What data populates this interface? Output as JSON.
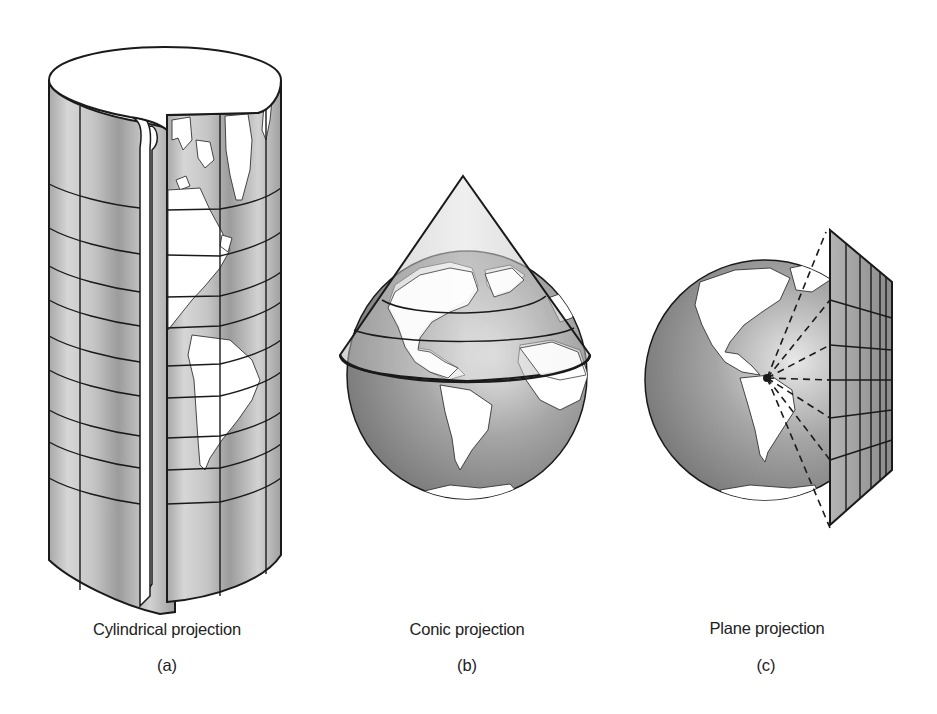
{
  "figure": {
    "panels": [
      {
        "id": "a",
        "caption": "Cylindrical projection",
        "label": "(a)"
      },
      {
        "id": "b",
        "caption": "Conic projection",
        "label": "(b)"
      },
      {
        "id": "c",
        "caption": "Plane projection",
        "label": "(c)"
      }
    ],
    "colors": {
      "land": "#ffffff",
      "ocean": "#9a9a9a",
      "surface_light": "#e6e6e6",
      "surface_dark": "#8e8e8e",
      "outline": "#1a1a1a"
    }
  }
}
